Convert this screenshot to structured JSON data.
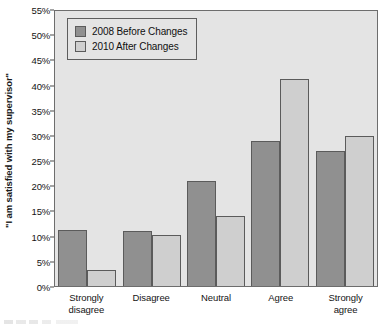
{
  "chart_data": {
    "type": "bar",
    "title": "",
    "subtitle": "",
    "xlabel": "",
    "ylabel": "\"I am satisfied with my supervisor\"",
    "categories": [
      "Strongly disagree",
      "Disagree",
      "Neutral",
      "Agree",
      "Strongly agree"
    ],
    "category_lines": [
      [
        "Strongly",
        "disagree"
      ],
      [
        "Disagree",
        ""
      ],
      [
        "Neutral",
        ""
      ],
      [
        "Agree",
        ""
      ],
      [
        "Strongly",
        "agree"
      ]
    ],
    "series": [
      {
        "name": "2008 Before Changes",
        "color": "#909090",
        "values": [
          11.2,
          11.0,
          21.0,
          29.0,
          27.0
        ]
      },
      {
        "name": "2010 After Changes",
        "color": "#cfcfcf",
        "values": [
          3.3,
          10.3,
          14.0,
          41.5,
          30.0
        ]
      }
    ],
    "ylim": [
      0,
      55
    ],
    "ytick_values": [
      0,
      5,
      10,
      15,
      20,
      25,
      30,
      35,
      40,
      45,
      50,
      55
    ],
    "ytick_labels": [
      "0%",
      "5%",
      "10%",
      "15%",
      "20%",
      "25%",
      "30%",
      "35%",
      "40%",
      "45%",
      "50%",
      "55%"
    ],
    "grid": false,
    "legend_position": "top-left",
    "plot_background": "#e4e4e4",
    "axis_color": "#6d6d6d",
    "bar_edge_color": "#5b5b5b"
  },
  "legend": {
    "items": [
      {
        "label": "2008 Before Changes",
        "swatch": "#909090"
      },
      {
        "label": "2010 After Changes",
        "swatch": "#cfcfcf"
      }
    ]
  }
}
